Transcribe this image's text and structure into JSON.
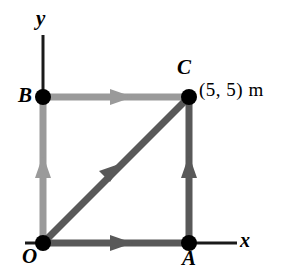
{
  "figure": {
    "background_color": "#ffffff",
    "width": 287,
    "height": 275
  },
  "axes": {
    "x_label": "x",
    "y_label": "y",
    "axis_color": "#1a1a1a",
    "x_axis_line": {
      "x1": 189,
      "y1": 243,
      "x2": 237,
      "y2": 243
    },
    "x_axis_stub_left": {
      "x1": 25,
      "y1": 243,
      "x2": 43,
      "y2": 243
    },
    "y_axis_line": {
      "x1": 43,
      "y1": 35,
      "x2": 43,
      "y2": 97
    }
  },
  "points": [
    {
      "id": "O",
      "label": "O",
      "x": 43,
      "y": 243,
      "coords": [
        0,
        0
      ]
    },
    {
      "id": "A",
      "label": "A",
      "x": 189,
      "y": 243,
      "coords": [
        5,
        0
      ]
    },
    {
      "id": "C",
      "label": "C",
      "x": 189,
      "y": 97,
      "coords": [
        5,
        5
      ]
    },
    {
      "id": "B",
      "label": "B",
      "x": 43,
      "y": 97,
      "coords": [
        0,
        5
      ]
    }
  ],
  "point_marker": {
    "color": "#000000",
    "radius": 7
  },
  "coordinate_annotation": {
    "text": "(5, 5) m",
    "for_point": "C"
  },
  "segments": [
    {
      "id": "O-to-B",
      "from": "O",
      "to": "B",
      "color": "#9a9a9a",
      "direction": "up",
      "arrow_at": "midpoint"
    },
    {
      "id": "B-to-C",
      "from": "B",
      "to": "C",
      "color": "#9a9a9a",
      "direction": "right",
      "arrow_at": "midpoint"
    },
    {
      "id": "O-to-A",
      "from": "O",
      "to": "A",
      "color": "#595959",
      "direction": "right",
      "arrow_at": "midpoint"
    },
    {
      "id": "A-to-C",
      "from": "A",
      "to": "C",
      "color": "#595959",
      "direction": "up",
      "arrow_at": "midpoint"
    },
    {
      "id": "O-to-C",
      "from": "O",
      "to": "C",
      "color": "#595959",
      "direction": "up-right",
      "arrow_at": "midpoint"
    }
  ],
  "colors": {
    "light_gray": "#9a9a9a",
    "dark_gray": "#595959",
    "black": "#000000",
    "background": "#ffffff"
  }
}
